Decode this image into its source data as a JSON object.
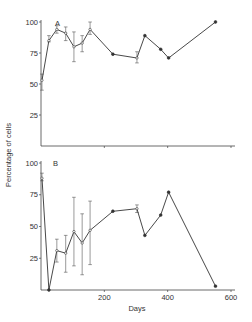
{
  "chart_data": [
    {
      "type": "line",
      "panel": "A",
      "title": "",
      "xlabel": "",
      "ylabel": "Percentage of cells",
      "xlim": [
        0,
        600
      ],
      "ylim": [
        0,
        100
      ],
      "yticks": [
        25,
        50,
        75,
        100
      ],
      "xticks": [
        200,
        400,
        600
      ],
      "grid": false,
      "x": [
        3,
        25,
        50,
        78,
        104,
        130,
        155,
        227,
        303,
        328,
        378,
        403,
        551
      ],
      "y": [
        53,
        85,
        94,
        91,
        80,
        83,
        94,
        74,
        71,
        89,
        78,
        71,
        100
      ],
      "error_low": [
        45,
        84,
        91,
        85,
        68,
        76,
        90,
        null,
        67,
        null,
        null,
        null,
        null
      ],
      "error_high": [
        58,
        89,
        97,
        96,
        92,
        89,
        100,
        null,
        76,
        null,
        null,
        null,
        null
      ]
    },
    {
      "type": "line",
      "panel": "B",
      "title": "",
      "xlabel": "Days",
      "ylabel": "Percentage of cells",
      "xlim": [
        0,
        600
      ],
      "ylim": [
        0,
        100
      ],
      "yticks": [
        25,
        50,
        75,
        100
      ],
      "xticks": [
        200,
        400,
        600
      ],
      "grid": false,
      "x": [
        3,
        25,
        50,
        78,
        104,
        130,
        155,
        227,
        303,
        328,
        378,
        403,
        551
      ],
      "y": [
        88,
        0,
        31,
        29,
        46,
        37,
        47,
        62,
        64,
        43,
        59,
        77,
        3
      ],
      "error_low": [
        86,
        null,
        22,
        14,
        19,
        12,
        20,
        null,
        61,
        null,
        null,
        null,
        null
      ],
      "error_high": [
        92,
        null,
        40,
        43,
        73,
        60,
        70,
        null,
        67,
        null,
        null,
        null,
        null
      ]
    }
  ],
  "labels": {
    "panel_a": "A",
    "panel_b": "B",
    "y_axis": "Percentage of cells",
    "x_axis": "Days",
    "yticks": [
      "25",
      "50",
      "75",
      "100"
    ],
    "xticks": [
      "200",
      "400",
      "600"
    ]
  },
  "style": {
    "line_color": "#333333",
    "error_color": "#555555",
    "axis_color": "#444444"
  }
}
